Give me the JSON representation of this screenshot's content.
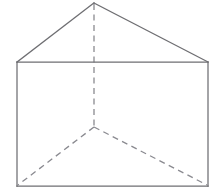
{
  "figure": {
    "subtitle": "Right prism with triangular cross-section, hidden edges dashed",
    "background_color": "#ffffff",
    "canvas": {
      "width": 217,
      "height": 194
    },
    "style": {
      "visible_edge_color": "#6e6e72",
      "hidden_edge_color": "#8a8a90",
      "visible_edge_width": 1.25,
      "hidden_edge_width": 1.3,
      "hidden_dash_pattern": "6 4.5",
      "face_fill_color": "#ffffff"
    },
    "vertices": {
      "apex_front": {
        "name": "apex-front",
        "x": 94,
        "y": 3
      },
      "rect_top_left": {
        "name": "front-top-left",
        "x": 17,
        "y": 62
      },
      "rect_top_right": {
        "name": "front-top-right",
        "x": 208,
        "y": 62
      },
      "rect_bottom_left": {
        "name": "front-bottom-left",
        "x": 17,
        "y": 186
      },
      "rect_bottom_right": {
        "name": "front-bottom-right",
        "x": 208,
        "y": 186
      },
      "rear_hidden": {
        "name": "rear-hidden-vertex",
        "x": 94,
        "y": 127
      }
    },
    "visible_edges": [
      {
        "name": "roof-slope-left",
        "points": "17,62 94,3"
      },
      {
        "name": "roof-slope-right",
        "points": "94,3 208,62"
      },
      {
        "name": "roof-base-horizontal",
        "points": "17,62 208,62"
      },
      {
        "name": "rect-left-side",
        "points": "17,62 17,186"
      },
      {
        "name": "rect-right-side",
        "points": "208,62 208,186"
      },
      {
        "name": "rect-bottom",
        "points": "17,186 208,186"
      }
    ],
    "hidden_edges": [
      {
        "name": "hidden-vertical-apex-to-rear",
        "points": "94,4 94,127"
      },
      {
        "name": "hidden-diagonal-rear-to-bottom-left",
        "points": "94,127 18,185"
      },
      {
        "name": "hidden-diagonal-rear-to-bottom-right",
        "points": "94,127 207,185"
      }
    ]
  }
}
